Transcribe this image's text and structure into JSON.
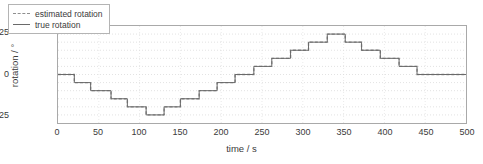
{
  "chart_data": {
    "type": "line",
    "title": "",
    "xlabel": "time / s",
    "ylabel": "rotation / °",
    "xlim": [
      0,
      500
    ],
    "ylim": [
      -30,
      30
    ],
    "xticks": [
      0,
      50,
      100,
      150,
      200,
      250,
      300,
      350,
      400,
      450,
      500
    ],
    "yticks": [
      -25,
      0,
      25
    ],
    "grid": true,
    "grid_style": "dotted-horizontal",
    "legend_position": "top-left",
    "interpolation": "step",
    "series": [
      {
        "name": "estimated rotation",
        "style": "dashed",
        "color": "#8f8f8f",
        "x": [
          0,
          20,
          20,
          40,
          40,
          65,
          65,
          85,
          85,
          108,
          108,
          130,
          130,
          150,
          150,
          173,
          173,
          195,
          195,
          217,
          217,
          240,
          240,
          262,
          262,
          285,
          285,
          307,
          307,
          330,
          330,
          352,
          352,
          372,
          372,
          395,
          395,
          418,
          418,
          440,
          440,
          500
        ],
        "y": [
          0,
          0,
          -5,
          -5,
          -10,
          -10,
          -15,
          -15,
          -20,
          -20,
          -25,
          -25,
          -20,
          -20,
          -15,
          -15,
          -10,
          -10,
          -5,
          -5,
          0,
          0,
          5,
          5,
          10,
          10,
          15,
          15,
          20,
          20,
          25,
          25,
          20,
          20,
          15,
          15,
          10,
          10,
          5,
          5,
          0,
          0
        ]
      },
      {
        "name": "true rotation",
        "style": "solid",
        "color": "#6a6a6a",
        "x": [
          0,
          20,
          20,
          40,
          40,
          65,
          65,
          85,
          85,
          108,
          108,
          130,
          130,
          150,
          150,
          173,
          173,
          195,
          195,
          217,
          217,
          240,
          240,
          262,
          262,
          285,
          285,
          307,
          307,
          330,
          330,
          352,
          352,
          372,
          372,
          395,
          395,
          418,
          418,
          440,
          440,
          500
        ],
        "y": [
          0,
          0,
          -5,
          -5,
          -10,
          -10,
          -15,
          -15,
          -20,
          -20,
          -25,
          -25,
          -20,
          -20,
          -15,
          -15,
          -10,
          -10,
          -5,
          -5,
          0,
          0,
          5,
          5,
          10,
          10,
          15,
          15,
          20,
          20,
          25,
          25,
          20,
          20,
          15,
          15,
          10,
          10,
          5,
          5,
          0,
          0
        ]
      }
    ],
    "gridlines_y": [
      -25,
      -20,
      -15,
      -10,
      -5,
      0,
      5,
      10,
      15,
      20,
      25
    ]
  },
  "legend": {
    "entries": [
      {
        "label": "estimated rotation"
      },
      {
        "label": "true rotation"
      }
    ]
  }
}
